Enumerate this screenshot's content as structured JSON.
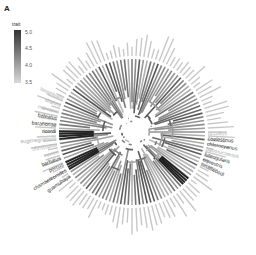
{
  "panel": {
    "label": "A"
  },
  "legend": {
    "title": "trait",
    "ticks": [
      "5.0",
      "4.5",
      "4.0",
      "3.5"
    ],
    "color_high": "#333333",
    "color_low": "#d9d9d9"
  },
  "tree": {
    "center": [
      132,
      132
    ],
    "radius_inner": 48,
    "radius_tips": 73,
    "branch_color_range": [
      "#cccccc",
      "#1f1f1f"
    ]
  },
  "tip_labels": {
    "left": [
      "longitibialis",
      "strahmi",
      "marcanoi",
      "baleatus",
      "barahonae",
      "ricordi",
      "eugenegrahami",
      "christophei",
      "cuvieri",
      "barbatus",
      "porcus",
      "chamaeleonides",
      "guamuhaya"
    ],
    "right": [
      "occultus",
      "coelestinus",
      "chlorocyanus",
      "bahorucoensis",
      "luteogularis",
      "equestris",
      "smallwoodi"
    ]
  }
}
